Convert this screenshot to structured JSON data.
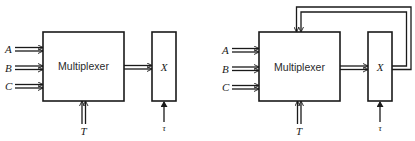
{
  "diagrams": [
    {
      "id": "without-feedback",
      "multiplexer_label": "Multiplexer",
      "inputs": [
        "A",
        "B",
        "C"
      ],
      "control_input": "T",
      "register_label": "X",
      "clock_input": "τ",
      "feedback": false
    },
    {
      "id": "with-feedback",
      "multiplexer_label": "Multiplexer",
      "inputs": [
        "A",
        "B",
        "C"
      ],
      "control_input": "T",
      "register_label": "X",
      "clock_input": "τ",
      "feedback": true
    }
  ],
  "colors": {
    "line": "#1a1a1a",
    "background": "#ffffff"
  }
}
